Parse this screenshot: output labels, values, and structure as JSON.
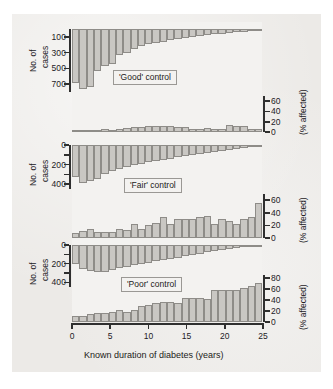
{
  "figure": {
    "xaxis_title": "Known duration of diabetes (years)",
    "xtick_labels": [
      "0",
      "5",
      "10",
      "15",
      "20",
      "25"
    ],
    "left_axis_title_line1": "No. of",
    "left_axis_title_line2": "cases",
    "right_axis_title": "(% affected)",
    "bar_fill": "#c9c7c3",
    "bar_stroke": "#8e8c88",
    "background": "#eceae7"
  },
  "panels": [
    {
      "tag": "'Good' control",
      "cases_ticks": [
        "100",
        "300",
        "500",
        "700"
      ],
      "pct_ticks": [
        "0",
        "20",
        "40",
        "60"
      ]
    },
    {
      "tag": "'Fair' control",
      "cases_ticks": [
        "0",
        "200",
        "400"
      ],
      "pct_ticks": [
        "0",
        "20",
        "40",
        "60"
      ]
    },
    {
      "tag": "'Poor' control",
      "cases_ticks": [
        "0",
        "200",
        "400"
      ],
      "pct_ticks": [
        "0",
        "20",
        "40",
        "60",
        "80"
      ]
    }
  ],
  "chart_data": {
    "type": "bar",
    "xlabel": "Known duration of diabetes (years)",
    "x": [
      0,
      1,
      2,
      3,
      4,
      5,
      6,
      7,
      8,
      9,
      10,
      11,
      12,
      13,
      14,
      15,
      16,
      17,
      18,
      19,
      20,
      21,
      22,
      23,
      24,
      25
    ],
    "grid": false,
    "legend": "none",
    "panels": [
      {
        "name": "'Good' control",
        "cases": {
          "ylabel": "No. of cases",
          "ylim": [
            800,
            0
          ],
          "direction": "downward",
          "ticks": [
            100,
            300,
            500,
            700
          ],
          "values": [
            690,
            760,
            740,
            530,
            470,
            450,
            330,
            300,
            260,
            215,
            190,
            175,
            160,
            145,
            130,
            115,
            100,
            88,
            78,
            68,
            58,
            48,
            40,
            32,
            24,
            16
          ]
        },
        "percent_affected": {
          "ylabel": "(% affected)",
          "ylim": [
            0,
            70
          ],
          "direction": "upward",
          "ticks": [
            0,
            20,
            40,
            60
          ],
          "values": [
            3,
            3,
            4,
            4,
            5,
            4,
            6,
            7,
            9,
            10,
            12,
            12,
            11,
            11,
            10,
            9,
            5,
            6,
            7,
            6,
            6,
            14,
            12,
            11,
            5,
            5
          ]
        }
      },
      {
        "name": "'Fair' control",
        "cases": {
          "ylabel": "No. of cases",
          "ylim": [
            450,
            0
          ],
          "direction": "downward",
          "ticks": [
            0,
            200,
            400
          ],
          "values": [
            330,
            390,
            370,
            350,
            300,
            270,
            245,
            225,
            205,
            190,
            175,
            160,
            150,
            140,
            125,
            115,
            105,
            92,
            80,
            68,
            58,
            48,
            38,
            28,
            20,
            12
          ]
        },
        "percent_affected": {
          "ylabel": "(% affected)",
          "ylim": [
            0,
            70
          ],
          "direction": "upward",
          "ticks": [
            0,
            20,
            40,
            60
          ],
          "values": [
            8,
            11,
            15,
            9,
            9,
            10,
            14,
            13,
            22,
            14,
            20,
            24,
            33,
            23,
            31,
            30,
            31,
            33,
            35,
            22,
            30,
            27,
            22,
            31,
            34,
            56
          ]
        }
      },
      {
        "name": "'Poor' control",
        "cases": {
          "ylabel": "No. of cases",
          "ylim": [
            450,
            0
          ],
          "direction": "downward",
          "ticks": [
            0,
            200,
            400
          ],
          "values": [
            200,
            255,
            280,
            290,
            290,
            270,
            250,
            240,
            215,
            200,
            190,
            175,
            160,
            150,
            135,
            120,
            105,
            92,
            78,
            65,
            52,
            42,
            32,
            22,
            14,
            8
          ]
        },
        "percent_affected": {
          "ylabel": "(% affected)",
          "ylim": [
            0,
            85
          ],
          "direction": "upward",
          "ticks": [
            0,
            20,
            40,
            60,
            80
          ],
          "values": [
            11,
            10,
            15,
            16,
            16,
            18,
            22,
            19,
            22,
            29,
            30,
            34,
            37,
            37,
            35,
            43,
            44,
            44,
            42,
            57,
            57,
            57,
            58,
            62,
            66,
            70
          ]
        }
      }
    ]
  }
}
